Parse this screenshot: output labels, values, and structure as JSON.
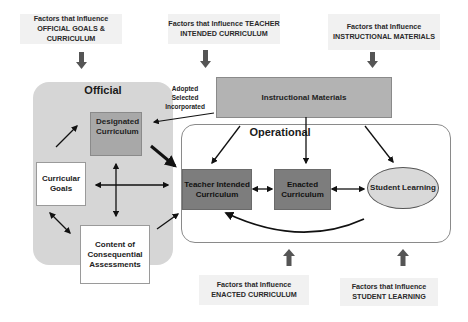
{
  "diagram": {
    "factors": {
      "official": "Factors that Influence OFFICIAL GOALS & CURRICULUM",
      "teacher": "Factors that Influence TEACHER INTENDED CURRICULUM",
      "materials": "Factors that Influence INSTRUCTIONAL MATERIALS",
      "enacted": "Factors that Influence  ENACTED CURRICULUM",
      "student": "Factors that Influence STUDENT LEARNING"
    },
    "official_panel": {
      "title": "Official",
      "designated": "Designated Curriculum",
      "goals": "Curricular Goals",
      "assessments": "Content of Consequential Assessments"
    },
    "operational_panel": {
      "title": "Operational",
      "teacher_intended": "Teacher Intended Curriculum",
      "enacted": "Enacted Curriculum",
      "student_learning": "Student Learning"
    },
    "instructional_materials": "Instructional Materials",
    "adoption_labels": {
      "line1": "Adopted",
      "line2": "Selected",
      "line3": "Incorporated"
    },
    "colors": {
      "official_bg": "#d6d6d6",
      "dark_box": "#7d7d7d",
      "mid_box": "#a8a8a8",
      "factor_bg": "#f1f1f1",
      "arrow": "#111111",
      "block_arrow": "#555555"
    }
  }
}
